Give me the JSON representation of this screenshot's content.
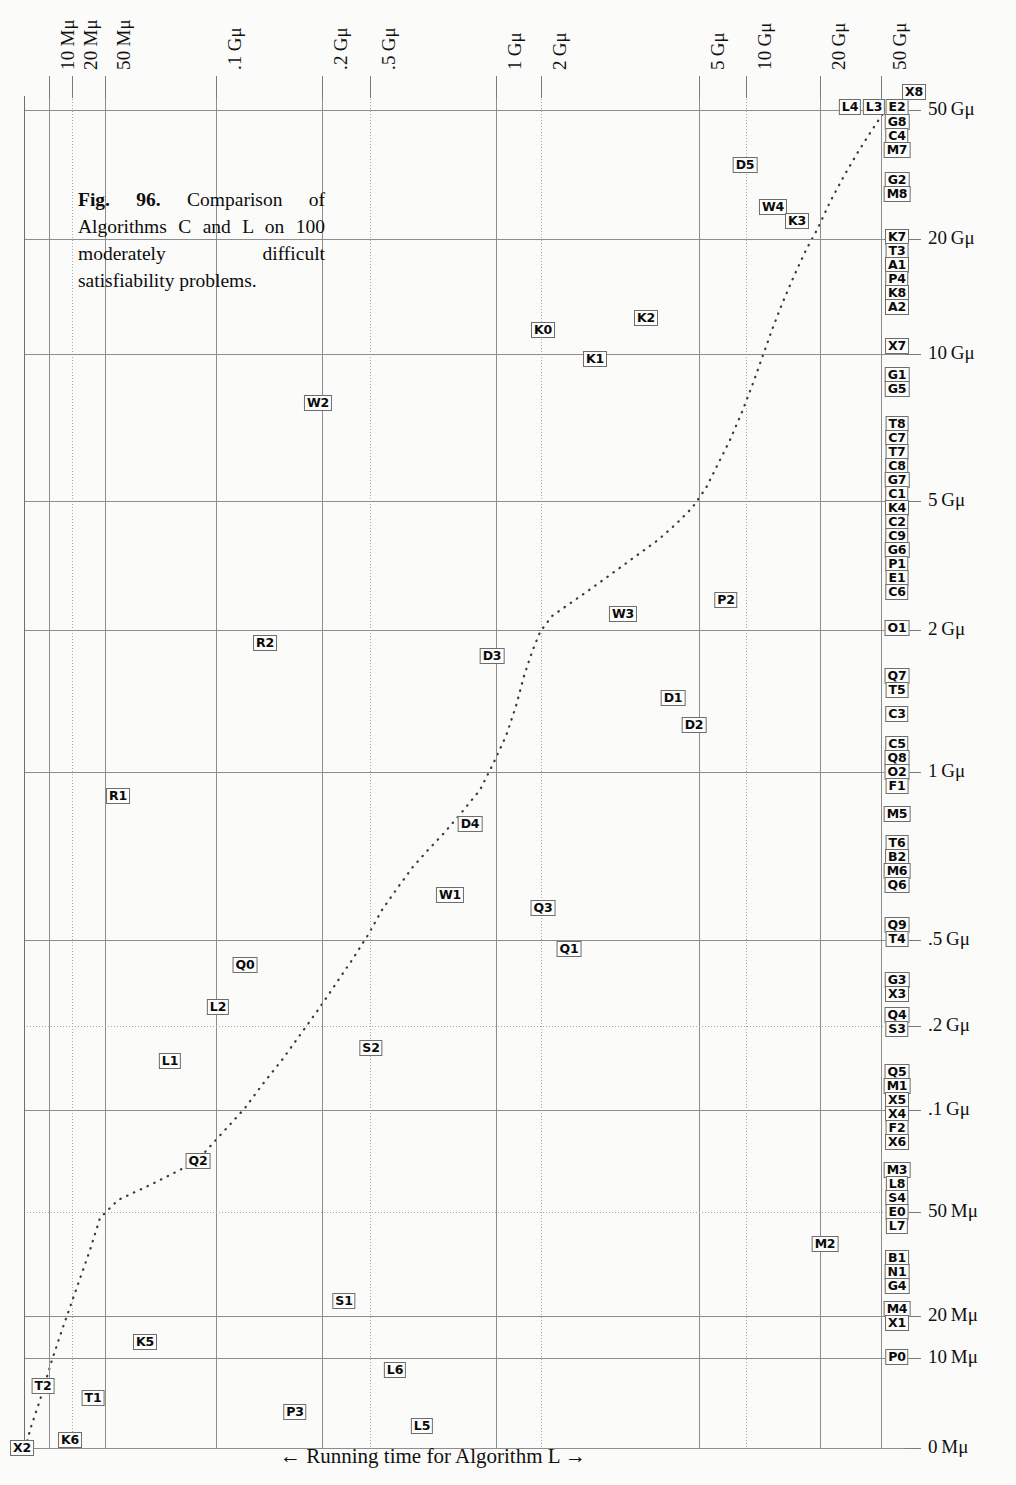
{
  "figure": {
    "caption_label": "Fig. 96.",
    "caption_text": " Comparison of Algorithms C and L on 100 moderately difficult satisfiability problems.",
    "x_axis_title": "← Running time for Algorithm L →",
    "y_axis_title": "← Running time for Algorithm C →"
  },
  "chart_data": {
    "type": "scatter",
    "title": "Fig. 96. Comparison of Algorithms C and L on 100 moderately difficult satisfiability problems.",
    "xlabel": "← Running time for Algorithm L →",
    "ylabel": "← Running time for Algorithm C →",
    "grid": true,
    "legend": "none",
    "scale": "log-like (mems)",
    "x_ticks": [
      {
        "label": "10 Mμ",
        "x": 49
      },
      {
        "label": "20 Mμ",
        "x": 72
      },
      {
        "label": "50 Mμ",
        "x": 105
      },
      {
        "label": ".1 Gμ",
        "x": 216
      },
      {
        "label": ".2 Gμ",
        "x": 322
      },
      {
        "label": ".5 Gμ",
        "x": 370
      },
      {
        "label": "1 Gμ",
        "x": 496
      },
      {
        "label": "2 Gμ",
        "x": 541
      },
      {
        "label": "5 Gμ",
        "x": 699
      },
      {
        "label": "10 Gμ",
        "x": 746
      },
      {
        "label": "20 Gμ",
        "x": 820
      },
      {
        "label": "50 Gμ",
        "x": 881
      }
    ],
    "y_ticks": [
      {
        "label": "50 Gμ",
        "y": 110
      },
      {
        "label": "20 Gμ",
        "y": 239
      },
      {
        "label": "10 Gμ",
        "y": 354
      },
      {
        "label": "5 Gμ",
        "y": 501
      },
      {
        "label": "2 Gμ",
        "y": 630
      },
      {
        "label": "1 Gμ",
        "y": 772
      },
      {
        "label": ".5 Gμ",
        "y": 940
      },
      {
        "label": ".2 Gμ",
        "y": 1026
      },
      {
        "label": ".1 Gμ",
        "y": 1110
      },
      {
        "label": "50 Mμ",
        "y": 1212
      },
      {
        "label": "20 Mμ",
        "y": 1316
      },
      {
        "label": "10 Mμ",
        "y": 1358
      },
      {
        "label": "0 Mμ",
        "y": 1448
      }
    ],
    "points": [
      {
        "label": "X8",
        "x": 914,
        "y": 92
      },
      {
        "label": "L4",
        "x": 850,
        "y": 107
      },
      {
        "label": "L3",
        "x": 874,
        "y": 107
      },
      {
        "label": "E2",
        "x": 897,
        "y": 107
      },
      {
        "label": "G8",
        "x": 897,
        "y": 122
      },
      {
        "label": "C4",
        "x": 897,
        "y": 136
      },
      {
        "label": "M7",
        "x": 897,
        "y": 150
      },
      {
        "label": "D5",
        "x": 745,
        "y": 165
      },
      {
        "label": "G2",
        "x": 897,
        "y": 180
      },
      {
        "label": "M8",
        "x": 897,
        "y": 194
      },
      {
        "label": "W4",
        "x": 773,
        "y": 207
      },
      {
        "label": "K3",
        "x": 797,
        "y": 221
      },
      {
        "label": "K7",
        "x": 897,
        "y": 237
      },
      {
        "label": "T3",
        "x": 897,
        "y": 251
      },
      {
        "label": "A1",
        "x": 897,
        "y": 265
      },
      {
        "label": "P4",
        "x": 897,
        "y": 279
      },
      {
        "label": "K8",
        "x": 897,
        "y": 293
      },
      {
        "label": "A2",
        "x": 897,
        "y": 307
      },
      {
        "label": "K0",
        "x": 543,
        "y": 330
      },
      {
        "label": "K2",
        "x": 646,
        "y": 318
      },
      {
        "label": "K1",
        "x": 595,
        "y": 359
      },
      {
        "label": "X7",
        "x": 897,
        "y": 346
      },
      {
        "label": "G1",
        "x": 897,
        "y": 375
      },
      {
        "label": "G5",
        "x": 897,
        "y": 389
      },
      {
        "label": "W2",
        "x": 318,
        "y": 403
      },
      {
        "label": "T8",
        "x": 897,
        "y": 424
      },
      {
        "label": "C7",
        "x": 897,
        "y": 438
      },
      {
        "label": "T7",
        "x": 897,
        "y": 452
      },
      {
        "label": "C8",
        "x": 897,
        "y": 466
      },
      {
        "label": "G7",
        "x": 897,
        "y": 480
      },
      {
        "label": "C1",
        "x": 897,
        "y": 494
      },
      {
        "label": "K4",
        "x": 897,
        "y": 508
      },
      {
        "label": "C2",
        "x": 897,
        "y": 522
      },
      {
        "label": "C9",
        "x": 897,
        "y": 536
      },
      {
        "label": "G6",
        "x": 897,
        "y": 550
      },
      {
        "label": "P1",
        "x": 897,
        "y": 564
      },
      {
        "label": "E1",
        "x": 897,
        "y": 578
      },
      {
        "label": "C6",
        "x": 897,
        "y": 592
      },
      {
        "label": "W3",
        "x": 623,
        "y": 614
      },
      {
        "label": "P2",
        "x": 726,
        "y": 600
      },
      {
        "label": "O1",
        "x": 897,
        "y": 628
      },
      {
        "label": "R2",
        "x": 265,
        "y": 643
      },
      {
        "label": "D3",
        "x": 492,
        "y": 656
      },
      {
        "label": "Q7",
        "x": 897,
        "y": 676
      },
      {
        "label": "T5",
        "x": 897,
        "y": 690
      },
      {
        "label": "D1",
        "x": 673,
        "y": 698
      },
      {
        "label": "D2",
        "x": 694,
        "y": 725
      },
      {
        "label": "C3",
        "x": 897,
        "y": 714
      },
      {
        "label": "C5",
        "x": 897,
        "y": 744
      },
      {
        "label": "Q8",
        "x": 897,
        "y": 758
      },
      {
        "label": "O2",
        "x": 897,
        "y": 772
      },
      {
        "label": "F1",
        "x": 897,
        "y": 786
      },
      {
        "label": "R1",
        "x": 118,
        "y": 796
      },
      {
        "label": "D4",
        "x": 470,
        "y": 824
      },
      {
        "label": "M5",
        "x": 897,
        "y": 814
      },
      {
        "label": "T6",
        "x": 897,
        "y": 843
      },
      {
        "label": "B2",
        "x": 897,
        "y": 857
      },
      {
        "label": "M6",
        "x": 897,
        "y": 871
      },
      {
        "label": "Q6",
        "x": 897,
        "y": 885
      },
      {
        "label": "W1",
        "x": 450,
        "y": 895
      },
      {
        "label": "Q3",
        "x": 543,
        "y": 908
      },
      {
        "label": "Q9",
        "x": 897,
        "y": 925
      },
      {
        "label": "T4",
        "x": 897,
        "y": 939
      },
      {
        "label": "Q1",
        "x": 569,
        "y": 949
      },
      {
        "label": "Q0",
        "x": 245,
        "y": 965
      },
      {
        "label": "G3",
        "x": 897,
        "y": 980
      },
      {
        "label": "X3",
        "x": 897,
        "y": 994
      },
      {
        "label": "L2",
        "x": 218,
        "y": 1007
      },
      {
        "label": "Q4",
        "x": 897,
        "y": 1015
      },
      {
        "label": "S3",
        "x": 897,
        "y": 1029
      },
      {
        "label": "L1",
        "x": 170,
        "y": 1061
      },
      {
        "label": "S2",
        "x": 371,
        "y": 1048
      },
      {
        "label": "Q5",
        "x": 897,
        "y": 1072
      },
      {
        "label": "M1",
        "x": 897,
        "y": 1086
      },
      {
        "label": "X5",
        "x": 897,
        "y": 1100
      },
      {
        "label": "X4",
        "x": 897,
        "y": 1114
      },
      {
        "label": "F2",
        "x": 897,
        "y": 1128
      },
      {
        "label": "X6",
        "x": 897,
        "y": 1142
      },
      {
        "label": "Q2",
        "x": 198,
        "y": 1161
      },
      {
        "label": "M3",
        "x": 897,
        "y": 1170
      },
      {
        "label": "L8",
        "x": 897,
        "y": 1184
      },
      {
        "label": "S4",
        "x": 897,
        "y": 1198
      },
      {
        "label": "E0",
        "x": 897,
        "y": 1212
      },
      {
        "label": "L7",
        "x": 897,
        "y": 1226
      },
      {
        "label": "M2",
        "x": 825,
        "y": 1244
      },
      {
        "label": "B1",
        "x": 897,
        "y": 1258
      },
      {
        "label": "N1",
        "x": 897,
        "y": 1272
      },
      {
        "label": "G4",
        "x": 897,
        "y": 1286
      },
      {
        "label": "S1",
        "x": 344,
        "y": 1301
      },
      {
        "label": "M4",
        "x": 897,
        "y": 1309
      },
      {
        "label": "X1",
        "x": 897,
        "y": 1323
      },
      {
        "label": "K5",
        "x": 145,
        "y": 1342
      },
      {
        "label": "P0",
        "x": 897,
        "y": 1357
      },
      {
        "label": "L6",
        "x": 395,
        "y": 1370
      },
      {
        "label": "T2",
        "x": 43,
        "y": 1386
      },
      {
        "label": "T1",
        "x": 93,
        "y": 1398
      },
      {
        "label": "P3",
        "x": 295,
        "y": 1412
      },
      {
        "label": "L5",
        "x": 422,
        "y": 1426
      },
      {
        "label": "K6",
        "x": 70,
        "y": 1440
      },
      {
        "label": "X2",
        "x": 22,
        "y": 1448
      }
    ],
    "reference_curve": {
      "description": "dotted monotone curve showing the median / equal-time relationship between Algorithm L and Algorithm C",
      "points": [
        [
          20,
          1470
        ],
        [
          30,
          1430
        ],
        [
          40,
          1400
        ],
        [
          52,
          1360
        ],
        [
          62,
          1330
        ],
        [
          76,
          1290
        ],
        [
          90,
          1250
        ],
        [
          100,
          1218
        ],
        [
          118,
          1200
        ],
        [
          150,
          1185
        ],
        [
          180,
          1170
        ],
        [
          205,
          1152
        ],
        [
          225,
          1130
        ],
        [
          245,
          1108
        ],
        [
          262,
          1085
        ],
        [
          282,
          1060
        ],
        [
          300,
          1035
        ],
        [
          318,
          1010
        ],
        [
          335,
          985
        ],
        [
          352,
          960
        ],
        [
          368,
          935
        ],
        [
          382,
          910
        ],
        [
          396,
          890
        ],
        [
          412,
          868
        ],
        [
          428,
          850
        ],
        [
          445,
          832
        ],
        [
          462,
          812
        ],
        [
          480,
          790
        ],
        [
          494,
          762
        ],
        [
          506,
          736
        ],
        [
          516,
          706
        ],
        [
          524,
          676
        ],
        [
          532,
          652
        ],
        [
          540,
          632
        ],
        [
          552,
          616
        ],
        [
          572,
          602
        ],
        [
          592,
          588
        ],
        [
          614,
          572
        ],
        [
          636,
          556
        ],
        [
          658,
          540
        ],
        [
          676,
          524
        ],
        [
          692,
          508
        ],
        [
          706,
          488
        ],
        [
          718,
          464
        ],
        [
          730,
          440
        ],
        [
          742,
          412
        ],
        [
          752,
          386
        ],
        [
          762,
          358
        ],
        [
          772,
          330
        ],
        [
          782,
          304
        ],
        [
          794,
          276
        ],
        [
          806,
          250
        ],
        [
          818,
          228
        ],
        [
          830,
          202
        ],
        [
          844,
          176
        ],
        [
          858,
          152
        ],
        [
          872,
          130
        ],
        [
          884,
          112
        ]
      ]
    }
  }
}
